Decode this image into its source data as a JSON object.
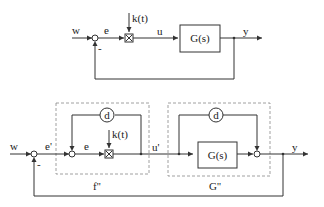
{
  "top_diagram": {
    "input": "w",
    "error": "e",
    "gain": "k(t)",
    "control": "u",
    "plant": "G(s)",
    "output": "y",
    "feedback_sign": "-"
  },
  "bottom_diagram": {
    "input": "w",
    "outer_error": "e'",
    "inner_error": "e",
    "gain": "k(t)",
    "control": "u'",
    "delay_1": "d",
    "delay_2": "d",
    "plant": "G(s)",
    "output": "y",
    "feedback_sign": "-",
    "subsystem_left_label": "f''",
    "subsystem_right_label": "G''"
  }
}
